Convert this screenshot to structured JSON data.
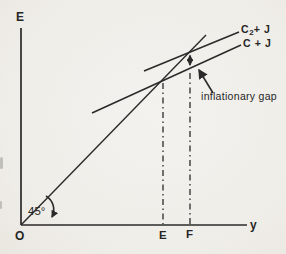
{
  "figure": {
    "axes": {
      "vertical_axis_label": "E",
      "horizontal_axis_label": "y",
      "origin_label": "O"
    },
    "angle": {
      "label": "45°"
    },
    "x_ticks": {
      "equilibrium_income": "E",
      "full_employment_income": "F"
    },
    "curves": {
      "c2_plus_j": {
        "base": "C",
        "sub": "2",
        "rest": "+ J"
      },
      "c_plus_j": {
        "label": "C + J"
      },
      "deg45_line": {
        "label": "45°"
      }
    },
    "annotation": {
      "label": "inflationary gap"
    },
    "colors": {
      "ink": "#2a2a2a",
      "paper": "#f1efeb"
    }
  }
}
